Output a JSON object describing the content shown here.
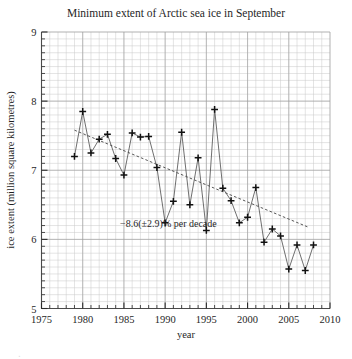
{
  "chart_data": {
    "type": "line",
    "title": "Minimum extent of Arctic sea ice in September",
    "xlabel": "year",
    "ylabel": "ice extent (million square kilometres)",
    "xlim": [
      1975,
      2010
    ],
    "ylim": [
      5,
      9
    ],
    "xticks": [
      1975,
      1980,
      1985,
      1990,
      1995,
      2000,
      2005,
      2010
    ],
    "yticks": [
      5,
      6,
      7,
      8,
      9
    ],
    "x_minor_step": 1,
    "y_minor_step": 0.1,
    "grid": true,
    "legend": "none",
    "marker": "plus",
    "annotations": [
      {
        "text": "−8.6(±2.9)% per decade",
        "x": 1990.4,
        "y": 6.18
      }
    ],
    "series": [
      {
        "name": "September Arctic sea ice minimum extent",
        "x": [
          1979,
          1980,
          1981,
          1982,
          1983,
          1984,
          1985,
          1986,
          1987,
          1988,
          1989,
          1990,
          1991,
          1992,
          1993,
          1994,
          1995,
          1996,
          1997,
          1998,
          1999,
          2000,
          2001,
          2002,
          2003,
          2004,
          2005,
          2006,
          2007,
          2008
        ],
        "values": [
          7.2,
          7.85,
          7.25,
          7.45,
          7.52,
          7.17,
          6.93,
          7.54,
          7.48,
          7.49,
          7.04,
          6.24,
          6.55,
          7.55,
          6.5,
          7.18,
          6.13,
          7.88,
          6.74,
          6.56,
          6.24,
          6.32,
          6.75,
          5.96,
          6.15,
          6.05,
          5.57,
          5.92,
          5.55,
          5.92
        ]
      }
    ],
    "trend": {
      "name": "linear trend",
      "x": [
        1979,
        2007.5
      ],
      "values": [
        7.58,
        6.17
      ],
      "style": "dashed"
    }
  },
  "caption": {
    "clipped_text": "."
  }
}
